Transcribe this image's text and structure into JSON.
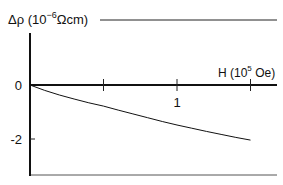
{
  "chart_data": {
    "type": "line",
    "title": "",
    "ylabel": "Δρ (10",
    "ylabel_exp": "−6",
    "ylabel_unit": "Ωcm)",
    "xlabel": "H (10",
    "xlabel_exp": "5",
    "xlabel_unit": " Oe)",
    "xlim": [
      0,
      1.65
    ],
    "ylim": [
      -3.3,
      2.4
    ],
    "x_ticks": [
      0.5,
      1,
      1.5
    ],
    "x_tick_labels": [
      {
        "value": 1,
        "label": "1"
      }
    ],
    "y_tick_labels": [
      {
        "value": 0,
        "label": "0"
      },
      {
        "value": -2,
        "label": "-2"
      }
    ],
    "grid": false,
    "series": [
      {
        "name": "Δρ vs H",
        "x": [
          0,
          0.1,
          0.2,
          0.3,
          0.4,
          0.5,
          0.6,
          0.7,
          0.8,
          0.9,
          1.0,
          1.1,
          1.2,
          1.3,
          1.4,
          1.5
        ],
        "y": [
          0,
          -0.2,
          -0.37,
          -0.52,
          -0.66,
          -0.78,
          -0.93,
          -1.07,
          -1.21,
          -1.35,
          -1.48,
          -1.6,
          -1.72,
          -1.83,
          -1.94,
          -2.04
        ]
      }
    ],
    "color": "#111111"
  }
}
